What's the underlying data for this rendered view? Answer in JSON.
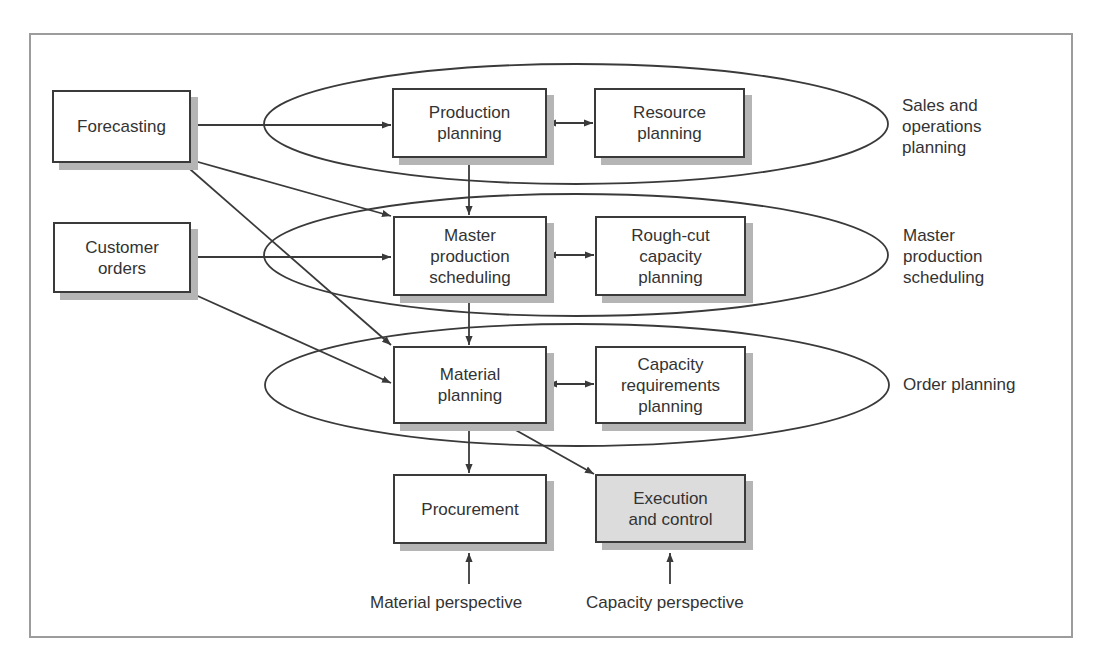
{
  "diagram": {
    "nodes": {
      "forecasting": "Forecasting",
      "customer_orders": "Customer\norders",
      "production_planning": "Production\nplanning",
      "resource_planning": "Resource\nplanning",
      "master_production_scheduling": "Master\nproduction\nscheduling",
      "rough_cut_capacity_planning": "Rough-cut\ncapacity\nplanning",
      "material_planning": "Material\nplanning",
      "capacity_requirements_planning": "Capacity\nrequirements\nplanning",
      "procurement": "Procurement",
      "execution_and_control": "Execution\nand control"
    },
    "levels": {
      "sales_and_operations_planning": "Sales and\noperations\nplanning",
      "master_production_scheduling": "Master\nproduction\nscheduling",
      "order_planning": "Order planning"
    },
    "perspectives": {
      "material": "Material perspective",
      "capacity": "Capacity perspective"
    },
    "colors": {
      "line": "#3a3a3a",
      "shadow": "#b5b5b5",
      "shaded_fill": "#dcdcdc",
      "frame": "#9c9c9c"
    }
  }
}
